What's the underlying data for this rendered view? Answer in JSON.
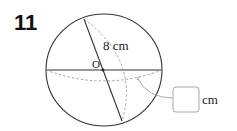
{
  "question": {
    "number": "11"
  },
  "diagram": {
    "shape": "sphere",
    "center_label": "O",
    "given_label": "8 cm",
    "answer_unit": "cm",
    "answer_value": "",
    "colors": {
      "outline": "#333333",
      "dashed": "#9a9a9a",
      "leader": "#a0a0a0",
      "box_border": "#a8a8a8"
    }
  }
}
